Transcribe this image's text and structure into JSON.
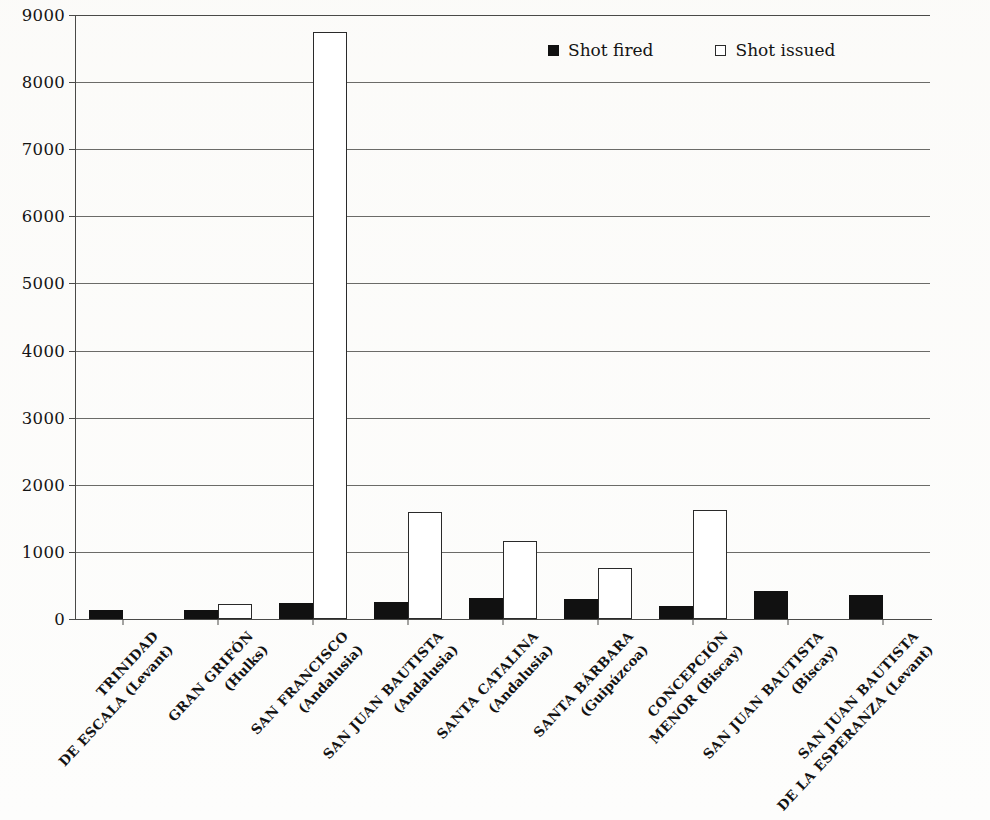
{
  "chart_data": {
    "type": "bar",
    "title": "",
    "xlabel": "",
    "ylabel": "",
    "ylim": [
      0,
      9000
    ],
    "ytick_values": [
      0,
      1000,
      2000,
      3000,
      4000,
      5000,
      6000,
      7000,
      8000,
      9000
    ],
    "ytick_labels": [
      "0",
      "1000",
      "2000",
      "3000",
      "4000",
      "5000",
      "6000",
      "7000",
      "8000",
      "9000"
    ],
    "grid": "horizontal",
    "legend_position": "top-right-inside",
    "categories": [
      {
        "name": "TRINIDAD DE ESCALA",
        "squadron": "(Levant)",
        "line1": "TRINIDAD",
        "line2": "DE ESCALA",
        "paren": "(Levant)"
      },
      {
        "name": "GRAN GRIFÓN",
        "squadron": "(Hulks)",
        "line1": "GRAN GRIFÓN",
        "line2": "",
        "paren": "(Hulks)"
      },
      {
        "name": "SAN FRANCISCO",
        "squadron": "(Andalusia)",
        "line1": "SAN FRANCISCO",
        "line2": "",
        "paren": "(Andalusia)"
      },
      {
        "name": "SAN JUAN BAUTISTA",
        "squadron": "(Andalusia)",
        "line1": "SAN JUAN BAUTISTA",
        "line2": "",
        "paren": "(Andalusia)"
      },
      {
        "name": "SANTA CATALINA",
        "squadron": "(Andalusia)",
        "line1": "SANTA CATALINA",
        "line2": "",
        "paren": "(Andalusia)"
      },
      {
        "name": "SANTA BÁRBARA",
        "squadron": "(Guipúzcoa)",
        "line1": "SANTA BÁRBARA",
        "line2": "",
        "paren": "(Guipúzcoa)"
      },
      {
        "name": "CONCEPCIÓN MENOR",
        "squadron": "(Biscay)",
        "line1": "CONCEPCIÓN",
        "line2": "MENOR",
        "paren": "(Biscay)"
      },
      {
        "name": "SAN JUAN BAUTISTA",
        "squadron": "(Biscay)",
        "line1": "SAN JUAN BAUTISTA",
        "line2": "",
        "paren": "(Biscay)"
      },
      {
        "name": "SAN JUAN BAUTISTA DE LA ESPERANZA",
        "squadron": "(Levant)",
        "line1": "SAN JUAN BAUTISTA",
        "line2": "DE LA ESPERANZA",
        "paren": "(Levant)"
      }
    ],
    "series": [
      {
        "name": "Shot fired",
        "color": "#111111",
        "style": "filled",
        "values": [
          130,
          130,
          245,
          250,
          310,
          305,
          200,
          415,
          365
        ]
      },
      {
        "name": "Shot issued",
        "color": "#ffffff",
        "style": "open",
        "values": [
          0,
          220,
          8750,
          1600,
          1160,
          760,
          1620,
          0,
          0
        ]
      }
    ]
  },
  "legend": {
    "items": [
      {
        "label": "Shot fired",
        "marker": "filled-square-icon"
      },
      {
        "label": "Shot issued",
        "marker": "open-square-icon"
      }
    ]
  }
}
